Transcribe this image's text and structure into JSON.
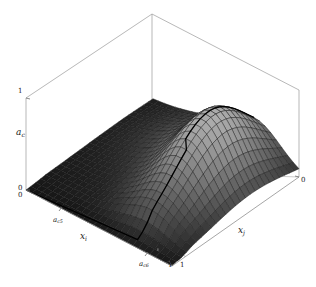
{
  "figure": {
    "kind": "3d-mesh-surface-plot",
    "background_color": "#ffffff",
    "box_line_color": "#9a9a9a",
    "mesh_line_color": "#1a1a1a",
    "surface_fill_dark": "#141414",
    "surface_fill_light": "#b4b4b4"
  },
  "axes": {
    "z": {
      "label": "a",
      "label_sub": "c",
      "ticks": [
        "1",
        "0"
      ],
      "tick_top": "1",
      "tick_bottom": "0"
    },
    "xi": {
      "label": "x",
      "label_sub": "i",
      "ticks": [
        "a",
        "a",
        "1"
      ],
      "tick_ac5_base": "a",
      "tick_ac5_sub": "c5",
      "tick_ac6_base": "a",
      "tick_ac6_sub": "c6",
      "tick_one": "1",
      "origin_tick": "0"
    },
    "xj": {
      "label": "x",
      "label_sub": "j",
      "tick_zero": "0",
      "tick_one": "1"
    }
  },
  "chart_data": {
    "type": "surface",
    "title": "",
    "xlabel": "x_i",
    "ylabel": "x_j",
    "zlabel": "a_c",
    "grid": false,
    "legend": null,
    "xlim": [
      0,
      1
    ],
    "ylim": [
      0,
      1
    ],
    "zlim": [
      0,
      1
    ],
    "x_tick_labels": [
      "a_c5",
      "a_c6",
      "1"
    ],
    "y_tick_labels": [
      "0",
      "1"
    ],
    "z_tick_labels": [
      "0",
      "1"
    ],
    "mesh_nx": 26,
    "mesh_ny": 26,
    "peak": {
      "x": 0.72,
      "y": 0.62,
      "z": 0.72
    },
    "surface_model": "z = 0.72 * exp(-(((u-0.72)^2)/(2*0.16^2) + ((v-0.62)^2)/(2*0.30^2)))",
    "z_values_sample": [
      [
        0.0,
        0.0,
        0.0,
        0.01,
        0.01,
        0.01,
        0.0,
        0.0
      ],
      [
        0.0,
        0.01,
        0.02,
        0.03,
        0.03,
        0.02,
        0.01,
        0.0
      ],
      [
        0.01,
        0.02,
        0.05,
        0.09,
        0.09,
        0.05,
        0.02,
        0.01
      ],
      [
        0.02,
        0.06,
        0.15,
        0.26,
        0.26,
        0.15,
        0.06,
        0.02
      ],
      [
        0.03,
        0.11,
        0.3,
        0.55,
        0.55,
        0.3,
        0.11,
        0.03
      ],
      [
        0.04,
        0.14,
        0.38,
        0.72,
        0.7,
        0.38,
        0.14,
        0.04
      ],
      [
        0.03,
        0.1,
        0.28,
        0.52,
        0.5,
        0.27,
        0.1,
        0.03
      ],
      [
        0.01,
        0.04,
        0.1,
        0.19,
        0.18,
        0.1,
        0.04,
        0.01
      ]
    ]
  }
}
